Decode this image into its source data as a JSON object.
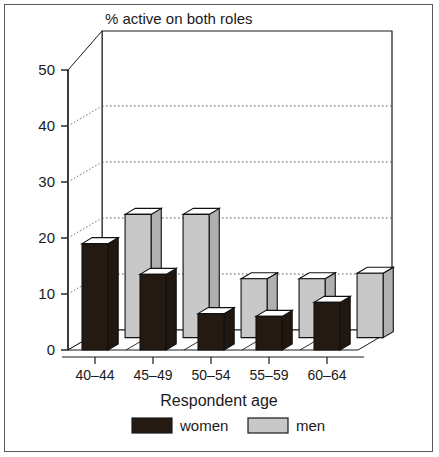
{
  "chart_data": {
    "type": "bar",
    "title": "% active on both roles",
    "xlabel": "Respondent age",
    "ylabel": "",
    "categories": [
      "40–44",
      "45–49",
      "50–54",
      "55–59",
      "60–64"
    ],
    "series": [
      {
        "name": "women",
        "color": "#241a12",
        "values": [
          19,
          13.5,
          6.5,
          6,
          8.5
        ]
      },
      {
        "name": "men",
        "color": "#c8c8c8",
        "values": [
          22,
          22,
          10.5,
          10.5,
          11.5
        ]
      }
    ],
    "ytick_labels": [
      "0",
      "10",
      "20",
      "30",
      "40",
      "50"
    ],
    "ytick_values": [
      0,
      10,
      20,
      30,
      40,
      50
    ],
    "ylim": [
      0,
      55
    ],
    "grid": "dotted-horizontal",
    "legend_position": "bottom",
    "style": "3d-grouped-column"
  },
  "legend": {
    "items": [
      {
        "label": "women",
        "swatch": "black-swatch"
      },
      {
        "label": "men",
        "swatch": "gray-swatch"
      }
    ]
  },
  "colors": {
    "women": "#241a12",
    "men": "#c8c8c8",
    "axis": "#1a1a1a",
    "grid": "#555555",
    "frame": "#5a5a5a",
    "background": "#ffffff"
  }
}
